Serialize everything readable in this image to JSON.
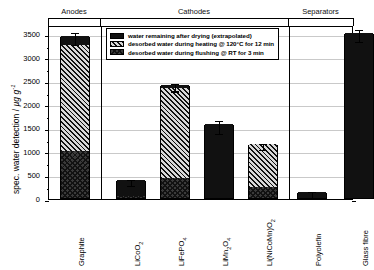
{
  "chart_data": {
    "type": "bar",
    "title": "",
    "xlabel": "",
    "ylabel": "spec. water detection / µg g⁻¹",
    "ylim": [
      0,
      3700
    ],
    "yticks": [
      0,
      500,
      1000,
      1500,
      2000,
      2500,
      3000,
      3500
    ],
    "ytick_labels": [
      "0",
      "500",
      "1000",
      "1500",
      "2000",
      "2500",
      "3000",
      "3500"
    ],
    "grid": true,
    "stacked": true,
    "legend_position": "upper-left-inside",
    "categories": [
      "Graphite",
      "LiCoO2",
      "LiFePO4",
      "LiMn2O4",
      "Li(NiCoMn)O2",
      "Polyolefin",
      "Glass fibre"
    ],
    "series": [
      {
        "name": "desorbed water during flushing @ RT for 3 min",
        "pattern": "cross-hatch",
        "values": [
          1010,
          50,
          430,
          0,
          230,
          0,
          0
        ]
      },
      {
        "name": "desorbed water during heating @ 120°C for 12 min",
        "pattern": "diagonal-hatch",
        "values": [
          2240,
          0,
          1910,
          0,
          920,
          0,
          0
        ]
      },
      {
        "name": "water remaining after drying (extrapolated)",
        "pattern": "solid",
        "values": [
          200,
          330,
          70,
          1570,
          0,
          130,
          3510
        ]
      }
    ],
    "totals": [
      3450,
      380,
      2410,
      1570,
      1150,
      130,
      3510
    ],
    "errors": [
      130,
      60,
      80,
      140,
      70,
      60,
      130
    ],
    "groups": [
      {
        "label": "Anodes",
        "categories": [
          "Graphite"
        ]
      },
      {
        "label": "Cathodes",
        "categories": [
          "LiCoO2",
          "LiFePO4",
          "LiMn2O4",
          "Li(NiCoMn)O2"
        ]
      },
      {
        "label": "Separators",
        "categories": [
          "Polyolefin",
          "Glass fibre"
        ]
      }
    ]
  },
  "axis": {
    "y_title_main": "spec. water detection / ",
    "y_title_unit": "µg g",
    "y_title_exp": "-1"
  },
  "categories_display": [
    {
      "base": "Graphite",
      "sub": ""
    },
    {
      "base": "LiCoO",
      "sub": "2"
    },
    {
      "base": "LiFePO",
      "sub": "4"
    },
    {
      "base": "LiMn",
      "sub": "2",
      "base2": "O",
      "sub2": "4"
    },
    {
      "base": "Li(NiCoMn)O",
      "sub": "2"
    },
    {
      "base": "Polyolefin",
      "sub": ""
    },
    {
      "base": "Glass fibre",
      "sub": ""
    }
  ],
  "groups": [
    {
      "label": "Anodes"
    },
    {
      "label": "Cathodes"
    },
    {
      "label": "Separators"
    }
  ],
  "legend": {
    "items": [
      {
        "label": "water remaining after drying (extrapolated)",
        "pattern": "solid"
      },
      {
        "label": "desorbed water during heating @ 120°C for 12 min",
        "pattern": "diagonal-hatch"
      },
      {
        "label": "desorbed water during flushing @ RT for 3 min",
        "pattern": "cross-hatch"
      }
    ]
  },
  "colors": {
    "solid": "#111111",
    "hatch_line": "#111111",
    "hatch_back": "#d8d8d8",
    "grid": "#c9c9c9",
    "frame": "#000000"
  }
}
